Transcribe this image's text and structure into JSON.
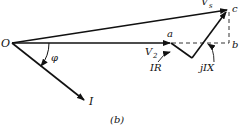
{
  "figure": {
    "caption": "(b)",
    "type": "phasor diagram",
    "points": {
      "origin": "O",
      "a": "a",
      "b": "b",
      "c": "c"
    },
    "vectors": {
      "sending_voltage": "V",
      "sending_voltage_sub": "s",
      "receiving_voltage": "V",
      "receiving_voltage_sub": "2",
      "current": "I",
      "resistive_drop": "IR",
      "reactive_drop": "jIX"
    },
    "angle": "φ",
    "colors": {
      "ink": "#111111",
      "background": "#ffffff"
    }
  }
}
